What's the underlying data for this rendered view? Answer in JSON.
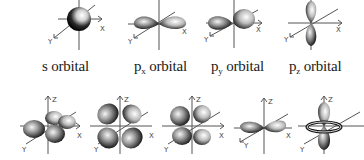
{
  "top_row": [
    {
      "id": "s",
      "prefix": "s",
      "sub": "",
      "suffix": " orbital"
    },
    {
      "id": "px",
      "prefix": "p",
      "sub": "x",
      "suffix": " orbital"
    },
    {
      "id": "py",
      "prefix": "p",
      "sub": "y",
      "suffix": " orbital"
    },
    {
      "id": "pz",
      "prefix": "p",
      "sub": "z",
      "suffix": " orbital"
    }
  ],
  "bottom_row": [
    {
      "id": "d1",
      "shape": "d-cloverleaf-tilted"
    },
    {
      "id": "d2",
      "shape": "d-cloverleaf-xz"
    },
    {
      "id": "d3",
      "shape": "d-cloverleaf-yz"
    },
    {
      "id": "d4",
      "shape": "d-x2-y2"
    },
    {
      "id": "d5",
      "shape": "d-z2"
    }
  ],
  "axes": {
    "x": "X",
    "y": "Y",
    "z": "Z"
  },
  "colors": {
    "lobe_dark": "#111111",
    "lobe_light": "#f2f2f2",
    "axis": "#555555"
  }
}
